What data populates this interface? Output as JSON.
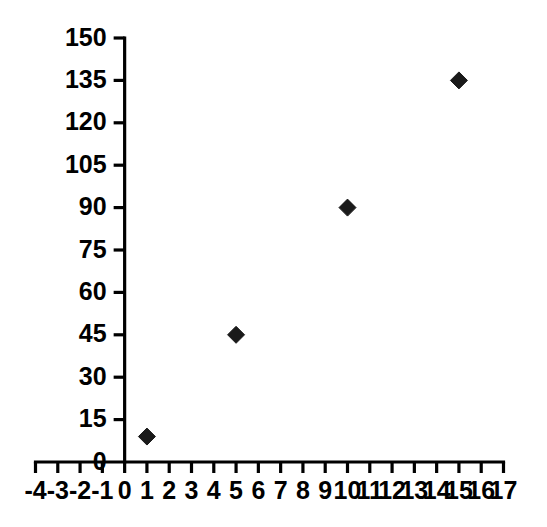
{
  "chart_data": {
    "type": "scatter",
    "title": "",
    "subtitle": "",
    "xlabel": "",
    "ylabel": "",
    "xlim": [
      -4,
      17
    ],
    "ylim": [
      0,
      150
    ],
    "grid": false,
    "legend": null,
    "marker": {
      "shape": "diamond",
      "color": "#1a1a1a",
      "size": 17
    },
    "x": [
      1,
      5,
      10,
      15
    ],
    "y": [
      9,
      45,
      90,
      135
    ],
    "points": [
      {
        "x": 1,
        "y": 9
      },
      {
        "x": 5,
        "y": 45
      },
      {
        "x": 10,
        "y": 90
      },
      {
        "x": 15,
        "y": 135
      }
    ],
    "x_ticks": [
      -4,
      -3,
      -2,
      -1,
      0,
      1,
      2,
      3,
      4,
      5,
      6,
      7,
      8,
      9,
      10,
      11,
      12,
      13,
      14,
      15,
      16,
      17
    ],
    "x_tick_labels": [
      "-4",
      "-3",
      "-2",
      "-1",
      "0",
      "1",
      "2",
      "3",
      "4",
      "5",
      "6",
      "7",
      "8",
      "9",
      "10",
      "11",
      "12",
      "13",
      "14",
      "15",
      "16",
      "17"
    ],
    "y_ticks": [
      0,
      15,
      30,
      45,
      60,
      75,
      90,
      105,
      120,
      135,
      150
    ],
    "y_tick_labels": [
      "0",
      "15",
      "30",
      "45",
      "60",
      "75",
      "90",
      "105",
      "120",
      "135",
      "150"
    ],
    "axis_color": "#000000",
    "background_color": "#ffffff"
  }
}
